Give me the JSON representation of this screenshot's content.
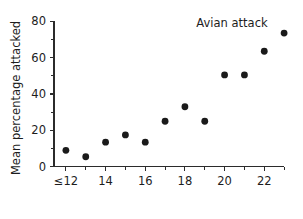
{
  "chart_data": {
    "type": "scatter",
    "title": "Avian attack",
    "xlabel": "",
    "ylabel": "Mean percentage attacked",
    "xlim": [
      11.4,
      23.6
    ],
    "ylim": [
      -4,
      84
    ],
    "grid": false,
    "legend": null,
    "x_tick_labels": [
      "≤12",
      "14",
      "16",
      "18",
      "20",
      "22"
    ],
    "x_tick_values": [
      12,
      14,
      16,
      18,
      20,
      22
    ],
    "x_minor_ticks": [
      13,
      15,
      17,
      19,
      21,
      23
    ],
    "y_tick_labels": [
      "0",
      "20",
      "40",
      "60",
      "80"
    ],
    "y_tick_values": [
      0,
      20,
      40,
      60,
      80
    ],
    "y_minor_ticks": [
      10,
      30,
      50,
      70
    ],
    "x": [
      12,
      13,
      14,
      15,
      16,
      17,
      18,
      19,
      20,
      21,
      22,
      23
    ],
    "values": [
      9,
      5.5,
      13.5,
      17.5,
      13.5,
      25,
      33,
      25,
      50.5,
      50.5,
      63.5,
      73.5
    ],
    "point_color": "#1a1a1a",
    "point_size": 3.4
  },
  "labels": {
    "title": "Avian attack",
    "y_axis_title": "Mean percentage attacked"
  }
}
